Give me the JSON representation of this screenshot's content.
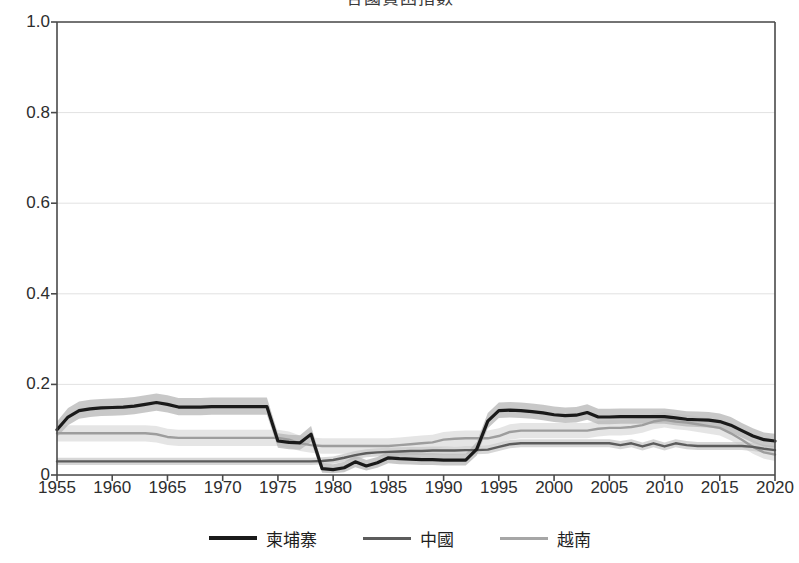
{
  "chart_data": {
    "type": "line",
    "title": "各國貧困指數",
    "xlabel": "",
    "ylabel": "",
    "xlim": [
      1955,
      2020
    ],
    "ylim": [
      0,
      1.0
    ],
    "grid": true,
    "legend_position": "bottom",
    "x_ticks": [
      1955,
      1960,
      1965,
      1970,
      1975,
      1980,
      1985,
      1990,
      1995,
      2000,
      2005,
      2010,
      2015,
      2020
    ],
    "y_ticks": [
      "0",
      "0.2",
      "0.4",
      "0.6",
      "0.8",
      "1.0"
    ],
    "y_tick_values": [
      0,
      0.2,
      0.4,
      0.6,
      0.8,
      1.0
    ],
    "x": [
      1955,
      1956,
      1957,
      1958,
      1959,
      1960,
      1961,
      1962,
      1963,
      1964,
      1965,
      1966,
      1967,
      1968,
      1969,
      1970,
      1971,
      1972,
      1973,
      1974,
      1975,
      1976,
      1977,
      1978,
      1979,
      1980,
      1981,
      1982,
      1983,
      1984,
      1985,
      1986,
      1987,
      1988,
      1989,
      1990,
      1991,
      1992,
      1993,
      1994,
      1995,
      1996,
      1997,
      1998,
      1999,
      2000,
      2001,
      2002,
      2003,
      2004,
      2005,
      2006,
      2007,
      2008,
      2009,
      2010,
      2011,
      2012,
      2013,
      2014,
      2015,
      2016,
      2017,
      2018,
      2019,
      2020
    ],
    "series": [
      {
        "name": "柬埔寨",
        "color": "#1a1a1a",
        "band_color": "#b5b5b5",
        "width": 3.2,
        "values": [
          0.1,
          0.128,
          0.142,
          0.146,
          0.148,
          0.149,
          0.15,
          0.152,
          0.156,
          0.16,
          0.156,
          0.15,
          0.15,
          0.15,
          0.151,
          0.151,
          0.151,
          0.151,
          0.151,
          0.151,
          0.075,
          0.072,
          0.071,
          0.09,
          0.014,
          0.012,
          0.016,
          0.029,
          0.02,
          0.027,
          0.038,
          0.036,
          0.035,
          0.034,
          0.034,
          0.033,
          0.033,
          0.033,
          0.057,
          0.119,
          0.142,
          0.143,
          0.142,
          0.14,
          0.137,
          0.133,
          0.131,
          0.132,
          0.138,
          0.128,
          0.128,
          0.129,
          0.129,
          0.129,
          0.129,
          0.129,
          0.126,
          0.123,
          0.122,
          0.121,
          0.118,
          0.11,
          0.098,
          0.086,
          0.078,
          0.075
        ],
        "lower": [
          0.084,
          0.11,
          0.124,
          0.128,
          0.13,
          0.131,
          0.132,
          0.134,
          0.138,
          0.142,
          0.138,
          0.132,
          0.132,
          0.132,
          0.133,
          0.133,
          0.133,
          0.133,
          0.133,
          0.133,
          0.06,
          0.057,
          0.056,
          0.073,
          0.005,
          0.004,
          0.006,
          0.017,
          0.01,
          0.016,
          0.026,
          0.024,
          0.023,
          0.022,
          0.022,
          0.021,
          0.021,
          0.021,
          0.043,
          0.103,
          0.126,
          0.127,
          0.126,
          0.124,
          0.121,
          0.117,
          0.115,
          0.116,
          0.122,
          0.112,
          0.112,
          0.113,
          0.113,
          0.113,
          0.113,
          0.113,
          0.11,
          0.107,
          0.106,
          0.105,
          0.102,
          0.094,
          0.083,
          0.071,
          0.063,
          0.06
        ],
        "upper": [
          0.118,
          0.148,
          0.162,
          0.166,
          0.168,
          0.169,
          0.17,
          0.172,
          0.176,
          0.18,
          0.176,
          0.17,
          0.17,
          0.17,
          0.171,
          0.171,
          0.171,
          0.171,
          0.171,
          0.171,
          0.092,
          0.089,
          0.088,
          0.108,
          0.026,
          0.024,
          0.029,
          0.043,
          0.033,
          0.04,
          0.052,
          0.05,
          0.049,
          0.048,
          0.048,
          0.047,
          0.047,
          0.047,
          0.073,
          0.137,
          0.16,
          0.161,
          0.16,
          0.158,
          0.155,
          0.151,
          0.149,
          0.15,
          0.156,
          0.146,
          0.146,
          0.147,
          0.147,
          0.147,
          0.147,
          0.147,
          0.144,
          0.141,
          0.14,
          0.139,
          0.136,
          0.128,
          0.115,
          0.103,
          0.094,
          0.091
        ]
      },
      {
        "name": "中國",
        "color": "#5c5c5c",
        "band_color": "#c9c9c9",
        "width": 2.4,
        "values": [
          0.03,
          0.03,
          0.03,
          0.03,
          0.03,
          0.03,
          0.03,
          0.03,
          0.03,
          0.03,
          0.03,
          0.03,
          0.03,
          0.03,
          0.03,
          0.03,
          0.03,
          0.03,
          0.03,
          0.03,
          0.03,
          0.03,
          0.03,
          0.03,
          0.031,
          0.033,
          0.038,
          0.044,
          0.048,
          0.05,
          0.051,
          0.052,
          0.053,
          0.053,
          0.054,
          0.054,
          0.054,
          0.055,
          0.055,
          0.056,
          0.062,
          0.068,
          0.07,
          0.07,
          0.07,
          0.07,
          0.07,
          0.07,
          0.07,
          0.07,
          0.07,
          0.066,
          0.07,
          0.063,
          0.07,
          0.063,
          0.07,
          0.066,
          0.064,
          0.064,
          0.064,
          0.064,
          0.064,
          0.062,
          0.058,
          0.055
        ],
        "lower": [
          0.022,
          0.022,
          0.022,
          0.022,
          0.022,
          0.022,
          0.022,
          0.022,
          0.022,
          0.022,
          0.022,
          0.022,
          0.022,
          0.022,
          0.022,
          0.022,
          0.022,
          0.022,
          0.022,
          0.022,
          0.022,
          0.022,
          0.022,
          0.022,
          0.023,
          0.025,
          0.029,
          0.035,
          0.039,
          0.041,
          0.042,
          0.043,
          0.044,
          0.044,
          0.045,
          0.045,
          0.045,
          0.046,
          0.046,
          0.047,
          0.053,
          0.059,
          0.061,
          0.061,
          0.061,
          0.061,
          0.061,
          0.061,
          0.061,
          0.061,
          0.061,
          0.057,
          0.061,
          0.054,
          0.061,
          0.054,
          0.061,
          0.057,
          0.055,
          0.055,
          0.055,
          0.055,
          0.055,
          0.053,
          0.049,
          0.046
        ],
        "upper": [
          0.038,
          0.038,
          0.038,
          0.038,
          0.038,
          0.038,
          0.038,
          0.038,
          0.038,
          0.038,
          0.038,
          0.038,
          0.038,
          0.038,
          0.038,
          0.038,
          0.038,
          0.038,
          0.038,
          0.038,
          0.038,
          0.038,
          0.038,
          0.038,
          0.039,
          0.041,
          0.047,
          0.053,
          0.057,
          0.059,
          0.06,
          0.061,
          0.062,
          0.062,
          0.063,
          0.063,
          0.063,
          0.064,
          0.064,
          0.065,
          0.071,
          0.077,
          0.079,
          0.079,
          0.079,
          0.079,
          0.079,
          0.079,
          0.079,
          0.079,
          0.079,
          0.075,
          0.079,
          0.072,
          0.079,
          0.072,
          0.079,
          0.075,
          0.073,
          0.073,
          0.073,
          0.073,
          0.073,
          0.071,
          0.067,
          0.064
        ]
      },
      {
        "name": "越南",
        "color": "#9d9d9d",
        "band_color": "#dcdcdc",
        "width": 2.4,
        "values": [
          0.092,
          0.092,
          0.092,
          0.092,
          0.092,
          0.092,
          0.092,
          0.092,
          0.092,
          0.09,
          0.084,
          0.082,
          0.082,
          0.082,
          0.082,
          0.082,
          0.082,
          0.082,
          0.082,
          0.082,
          0.082,
          0.078,
          0.07,
          0.066,
          0.064,
          0.064,
          0.064,
          0.064,
          0.064,
          0.064,
          0.064,
          0.066,
          0.068,
          0.07,
          0.072,
          0.078,
          0.08,
          0.081,
          0.081,
          0.081,
          0.086,
          0.095,
          0.098,
          0.098,
          0.098,
          0.098,
          0.098,
          0.098,
          0.098,
          0.102,
          0.104,
          0.104,
          0.106,
          0.11,
          0.118,
          0.122,
          0.118,
          0.116,
          0.112,
          0.108,
          0.104,
          0.092,
          0.078,
          0.062,
          0.05,
          0.045
        ],
        "lower": [
          0.074,
          0.074,
          0.074,
          0.074,
          0.074,
          0.074,
          0.074,
          0.074,
          0.074,
          0.072,
          0.066,
          0.064,
          0.064,
          0.064,
          0.064,
          0.064,
          0.064,
          0.064,
          0.064,
          0.064,
          0.064,
          0.06,
          0.053,
          0.049,
          0.047,
          0.047,
          0.047,
          0.047,
          0.047,
          0.047,
          0.047,
          0.049,
          0.051,
          0.053,
          0.055,
          0.061,
          0.063,
          0.064,
          0.064,
          0.064,
          0.069,
          0.078,
          0.081,
          0.081,
          0.081,
          0.081,
          0.081,
          0.081,
          0.081,
          0.085,
          0.087,
          0.087,
          0.089,
          0.093,
          0.101,
          0.105,
          0.101,
          0.099,
          0.095,
          0.091,
          0.087,
          0.076,
          0.062,
          0.047,
          0.036,
          0.031
        ],
        "upper": [
          0.11,
          0.11,
          0.11,
          0.11,
          0.11,
          0.11,
          0.11,
          0.11,
          0.11,
          0.108,
          0.102,
          0.1,
          0.1,
          0.1,
          0.1,
          0.1,
          0.1,
          0.1,
          0.1,
          0.1,
          0.1,
          0.096,
          0.087,
          0.083,
          0.081,
          0.081,
          0.081,
          0.081,
          0.081,
          0.081,
          0.081,
          0.083,
          0.085,
          0.087,
          0.089,
          0.095,
          0.097,
          0.098,
          0.098,
          0.098,
          0.103,
          0.112,
          0.115,
          0.115,
          0.115,
          0.115,
          0.115,
          0.115,
          0.115,
          0.119,
          0.121,
          0.121,
          0.123,
          0.127,
          0.135,
          0.139,
          0.135,
          0.133,
          0.129,
          0.125,
          0.121,
          0.108,
          0.094,
          0.077,
          0.064,
          0.059
        ]
      }
    ]
  },
  "legend": {
    "items": [
      {
        "label": "柬埔寨",
        "color": "#1a1a1a",
        "width": 4
      },
      {
        "label": "中國",
        "color": "#5c5c5c",
        "width": 3
      },
      {
        "label": "越南",
        "color": "#a6a6a6",
        "width": 3
      }
    ]
  },
  "colors": {
    "axis": "#4a4a4a",
    "grid": "#e2e2e2",
    "background": "#ffffff",
    "text": "#2d2d2d"
  }
}
